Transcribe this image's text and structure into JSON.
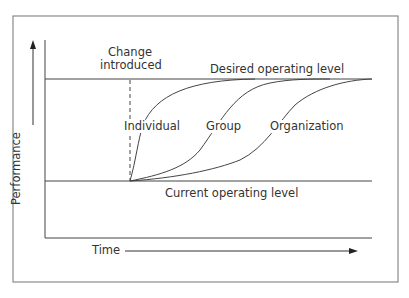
{
  "diagram": {
    "labels": {
      "change_introduced_line1": "Change",
      "change_introduced_line2": "introduced",
      "desired_level": "Desired operating level",
      "current_level": "Current operating level",
      "individual": "Individual",
      "group": "Group",
      "organization": "Organization",
      "y_axis": "Performance",
      "x_axis": "Time"
    },
    "colors": {
      "line": "#4a4a4a",
      "border": "#8a8a8a",
      "text": "#333333",
      "background": "#ffffff"
    },
    "curves": [
      {
        "name": "Individual",
        "start": [
          130,
          181
        ],
        "end": [
          255,
          79
        ]
      },
      {
        "name": "Group",
        "start": [
          130,
          181
        ],
        "end": [
          330,
          79
        ]
      },
      {
        "name": "Organization",
        "start": [
          130,
          181
        ],
        "end": [
          372,
          79
        ]
      }
    ]
  }
}
